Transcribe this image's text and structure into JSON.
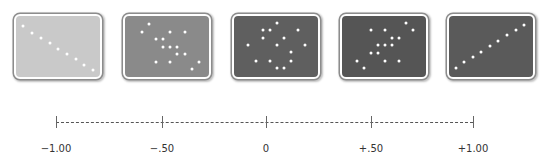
{
  "panels": [
    {
      "id": "r-minus-1",
      "x": 14,
      "fill": "#c9c9c9",
      "dots": [
        [
          9,
          12
        ],
        [
          18,
          19
        ],
        [
          27,
          24
        ],
        [
          36,
          29
        ],
        [
          44,
          35
        ],
        [
          53,
          40
        ],
        [
          62,
          45
        ],
        [
          70,
          51
        ],
        [
          79,
          56
        ]
      ]
    },
    {
      "id": "r-minus-0.5",
      "x": 123,
      "fill": "#8a8a8a",
      "dots": [
        [
          26,
          10
        ],
        [
          19,
          18
        ],
        [
          47,
          18
        ],
        [
          62,
          18
        ],
        [
          33,
          25
        ],
        [
          40,
          25
        ],
        [
          40,
          33
        ],
        [
          47,
          33
        ],
        [
          54,
          33
        ],
        [
          54,
          40
        ],
        [
          62,
          40
        ],
        [
          33,
          48
        ],
        [
          47,
          48
        ],
        [
          76,
          48
        ],
        [
          69,
          55
        ]
      ]
    },
    {
      "id": "r-zero",
      "x": 232,
      "fill": "#5f5f5f",
      "dots": [
        [
          45,
          9
        ],
        [
          31,
          16
        ],
        [
          38,
          16
        ],
        [
          66,
          16
        ],
        [
          31,
          24
        ],
        [
          52,
          24
        ],
        [
          16,
          31
        ],
        [
          45,
          31
        ],
        [
          73,
          31
        ],
        [
          59,
          38
        ],
        [
          24,
          47
        ],
        [
          38,
          47
        ],
        [
          59,
          47
        ],
        [
          45,
          54
        ],
        [
          52,
          54
        ]
      ]
    },
    {
      "id": "r-plus-0.5",
      "x": 340,
      "fill": "#555555",
      "dots": [
        [
          66,
          9
        ],
        [
          31,
          16
        ],
        [
          45,
          16
        ],
        [
          73,
          16
        ],
        [
          52,
          24
        ],
        [
          59,
          24
        ],
        [
          38,
          31
        ],
        [
          45,
          31
        ],
        [
          52,
          31
        ],
        [
          31,
          39
        ],
        [
          38,
          39
        ],
        [
          17,
          47
        ],
        [
          45,
          47
        ],
        [
          59,
          47
        ],
        [
          24,
          54
        ]
      ]
    },
    {
      "id": "r-plus-1",
      "x": 447,
      "fill": "#5a5a5a",
      "dots": [
        [
          9,
          54
        ],
        [
          17,
          48
        ],
        [
          26,
          43
        ],
        [
          34,
          38
        ],
        [
          43,
          32
        ],
        [
          51,
          27
        ],
        [
          60,
          21
        ],
        [
          69,
          16
        ],
        [
          77,
          11
        ]
      ]
    }
  ],
  "axis": {
    "ticks": [
      {
        "label": "−1.00",
        "x": 56
      },
      {
        "label": "−.50",
        "x": 162
      },
      {
        "label": "0",
        "x": 266
      },
      {
        "label": "+.50",
        "x": 371
      },
      {
        "label": "+1.00",
        "x": 473
      }
    ]
  },
  "chart_data": {
    "type": "scatter",
    "title": "",
    "xlabel": "Correlation coefficient",
    "categories": [
      "-1.00",
      "-.50",
      "0",
      "+.50",
      "+1.00"
    ],
    "series": [
      {
        "name": "-1.00",
        "points": [
          [
            9,
            12
          ],
          [
            18,
            19
          ],
          [
            27,
            24
          ],
          [
            36,
            29
          ],
          [
            44,
            35
          ],
          [
            53,
            40
          ],
          [
            62,
            45
          ],
          [
            70,
            51
          ],
          [
            79,
            56
          ]
        ]
      },
      {
        "name": "-.50",
        "points": [
          [
            26,
            10
          ],
          [
            19,
            18
          ],
          [
            47,
            18
          ],
          [
            62,
            18
          ],
          [
            33,
            25
          ],
          [
            40,
            25
          ],
          [
            40,
            33
          ],
          [
            47,
            33
          ],
          [
            54,
            33
          ],
          [
            54,
            40
          ],
          [
            62,
            40
          ],
          [
            33,
            48
          ],
          [
            47,
            48
          ],
          [
            76,
            48
          ],
          [
            69,
            55
          ]
        ]
      },
      {
        "name": "0",
        "points": [
          [
            45,
            9
          ],
          [
            31,
            16
          ],
          [
            38,
            16
          ],
          [
            66,
            16
          ],
          [
            31,
            24
          ],
          [
            52,
            24
          ],
          [
            16,
            31
          ],
          [
            45,
            31
          ],
          [
            73,
            31
          ],
          [
            59,
            38
          ],
          [
            24,
            47
          ],
          [
            38,
            47
          ],
          [
            59,
            47
          ],
          [
            45,
            54
          ],
          [
            52,
            54
          ]
        ]
      },
      {
        "name": "+.50",
        "points": [
          [
            66,
            9
          ],
          [
            31,
            16
          ],
          [
            45,
            16
          ],
          [
            73,
            16
          ],
          [
            52,
            24
          ],
          [
            59,
            24
          ],
          [
            38,
            31
          ],
          [
            45,
            31
          ],
          [
            52,
            31
          ],
          [
            31,
            39
          ],
          [
            38,
            39
          ],
          [
            17,
            47
          ],
          [
            45,
            47
          ],
          [
            59,
            47
          ],
          [
            24,
            54
          ]
        ]
      },
      {
        "name": "+1.00",
        "points": [
          [
            9,
            54
          ],
          [
            17,
            48
          ],
          [
            26,
            43
          ],
          [
            34,
            38
          ],
          [
            43,
            32
          ],
          [
            51,
            27
          ],
          [
            60,
            21
          ],
          [
            69,
            16
          ],
          [
            77,
            11
          ]
        ]
      }
    ],
    "axis_range": [
      -1.0,
      1.0
    ],
    "grid": false,
    "legend": "none"
  }
}
